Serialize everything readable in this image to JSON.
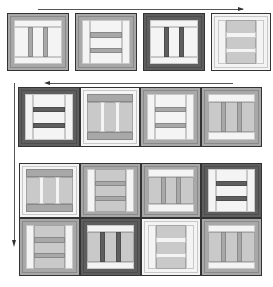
{
  "diagram": {
    "title": "",
    "colors": {
      "white": "#f4f4f4",
      "light": "#c9c9c9",
      "mid": "#a8a8a8",
      "dark": "#5e5e5e",
      "outline": "#333333"
    },
    "arrows": [
      {
        "id": "top-arrow",
        "direction": "right"
      },
      {
        "id": "row2-arrow",
        "direction": "left"
      },
      {
        "id": "left-arrow",
        "direction": "down"
      }
    ],
    "rows": [
      {
        "row": 1,
        "blocks": [
          {
            "pattern": "vertical-bars",
            "frame": "mid",
            "center": "white"
          },
          {
            "pattern": "horizontal-bars",
            "frame": "mid",
            "center": "white"
          },
          {
            "pattern": "vertical-bars",
            "frame": "dark",
            "center": "white"
          },
          {
            "pattern": "horizontal-bars",
            "frame": "white",
            "center": "mid"
          }
        ]
      },
      {
        "row": 2,
        "blocks": [
          {
            "pattern": "horizontal-bars",
            "frame": "dark",
            "center": "white"
          },
          {
            "pattern": "vertical-bars",
            "frame": "white",
            "center": "mid"
          },
          {
            "pattern": "horizontal-bars",
            "frame": "mid",
            "center": "white"
          },
          {
            "pattern": "vertical-bars",
            "frame": "mid",
            "center": "light"
          }
        ]
      },
      {
        "row": 3,
        "blocks": [
          {
            "pattern": "vertical-bars",
            "frame": "white",
            "center": "light"
          },
          {
            "pattern": "horizontal-bars",
            "frame": "mid",
            "center": "mid"
          },
          {
            "pattern": "vertical-bars",
            "frame": "mid",
            "center": "mid"
          },
          {
            "pattern": "horizontal-bars",
            "frame": "dark",
            "center": "white"
          }
        ]
      },
      {
        "row": 4,
        "blocks": [
          {
            "pattern": "horizontal-bars",
            "frame": "mid",
            "center": "light"
          },
          {
            "pattern": "vertical-bars",
            "frame": "dark",
            "center": "light"
          },
          {
            "pattern": "horizontal-bars",
            "frame": "white",
            "center": "light"
          },
          {
            "pattern": "vertical-bars",
            "frame": "mid",
            "center": "light"
          }
        ]
      }
    ]
  }
}
